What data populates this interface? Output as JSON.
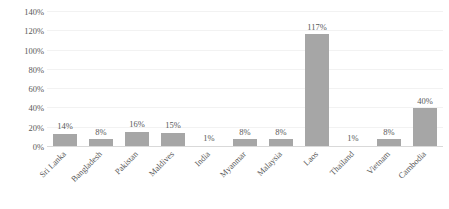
{
  "chart_data": {
    "type": "bar",
    "title": "",
    "subtitle": "",
    "xlabel": "",
    "ylabel": "",
    "categories": [
      "Sri Lanka",
      "Bangladesh",
      "Pakistan",
      "Maldives",
      "India",
      "Myanmar",
      "Malaysia",
      "Laos",
      "Thailand",
      "Vietnam",
      "Cambodia"
    ],
    "values": [
      14,
      8,
      16,
      15,
      1,
      8,
      8,
      117,
      1,
      8,
      40
    ],
    "data_labels": [
      "14%",
      "8%",
      "16%",
      "15%",
      "1%",
      "8%",
      "8%",
      "117%",
      "1%",
      "8%",
      "40%"
    ],
    "ylim": [
      0,
      140
    ],
    "ytick_values": [
      0,
      20,
      40,
      60,
      80,
      100,
      120,
      140
    ],
    "ytick_labels": [
      "0%",
      "20%",
      "40%",
      "60%",
      "80%",
      "100%",
      "120%",
      "140%"
    ],
    "grid": true,
    "legend": false,
    "legend_position": "none",
    "bar_color": "#a6a6a6",
    "gridline_color": "#f2f2f2",
    "axis_color": "#d9d9d9",
    "text_color": "#595959",
    "background_color": "#ffffff"
  }
}
